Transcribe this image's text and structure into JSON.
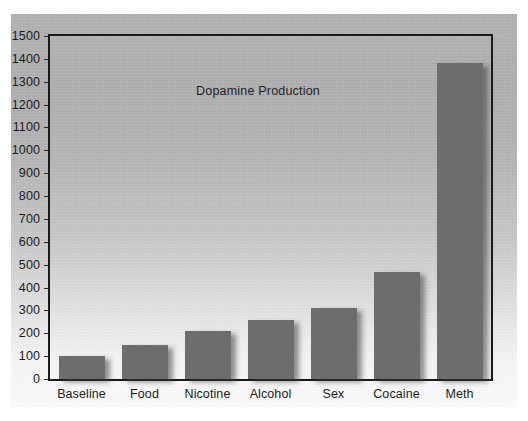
{
  "chart_data": {
    "type": "bar",
    "title": "Dopamine Production",
    "xlabel": "",
    "ylabel": "",
    "categories": [
      "Baseline",
      "Food",
      "Nicotine",
      "Alcohol",
      "Sex",
      "Cocaine",
      "Meth"
    ],
    "values": [
      100,
      150,
      210,
      260,
      310,
      470,
      1380
    ],
    "ylim": [
      0,
      1500
    ],
    "ytick_step": 100,
    "yticks": [
      0,
      100,
      200,
      300,
      400,
      500,
      600,
      700,
      800,
      900,
      1000,
      1100,
      1200,
      1300,
      1400,
      1500
    ],
    "ytick_labels": [
      "0",
      "100",
      "200",
      "300",
      "400",
      "500",
      "600",
      "700",
      "800",
      "900",
      "1000",
      "1100",
      "1200",
      "1300",
      "1400",
      "1500"
    ],
    "grid": false,
    "legend": null,
    "legend_position": "none",
    "bar_color": "#6d6d6d",
    "frame_color": "#1a1a1a",
    "background": "gray-to-white-vertical-gradient",
    "title_position": "inside-plot-upper-center-left",
    "annotations": []
  }
}
